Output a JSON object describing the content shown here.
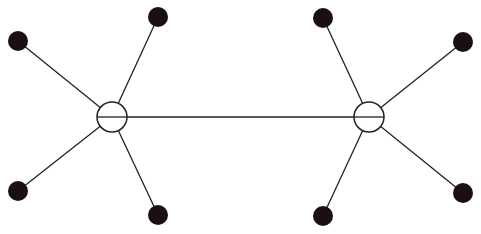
{
  "diagram": {
    "type": "graph",
    "colors": {
      "stroke": "#222222",
      "leaf_fill": "#1a1014",
      "hub_fill": "#ffffff",
      "background": "#ffffff"
    },
    "hubs": [
      {
        "id": "hub-left",
        "cx": 112,
        "cy": 117,
        "r": 15
      },
      {
        "id": "hub-right",
        "cx": 369,
        "cy": 117,
        "r": 15
      }
    ],
    "leaves": [
      {
        "id": "leaf-left-top-outer",
        "cx": 18,
        "cy": 41,
        "r": 10,
        "hub": "hub-left"
      },
      {
        "id": "leaf-left-top-inner",
        "cx": 158,
        "cy": 17,
        "r": 10,
        "hub": "hub-left"
      },
      {
        "id": "leaf-left-bottom-outer",
        "cx": 18,
        "cy": 191,
        "r": 10,
        "hub": "hub-left"
      },
      {
        "id": "leaf-left-bottom-inner",
        "cx": 158,
        "cy": 215,
        "r": 10,
        "hub": "hub-left"
      },
      {
        "id": "leaf-right-top-inner",
        "cx": 323,
        "cy": 18,
        "r": 10,
        "hub": "hub-right"
      },
      {
        "id": "leaf-right-top-outer",
        "cx": 463,
        "cy": 42,
        "r": 10,
        "hub": "hub-right"
      },
      {
        "id": "leaf-right-bottom-inner",
        "cx": 323,
        "cy": 216,
        "r": 10,
        "hub": "hub-right"
      },
      {
        "id": "leaf-right-bottom-outer",
        "cx": 463,
        "cy": 193,
        "r": 10,
        "hub": "hub-right"
      }
    ],
    "edges": [
      {
        "from": "hub-left",
        "to": "hub-right"
      }
    ]
  }
}
